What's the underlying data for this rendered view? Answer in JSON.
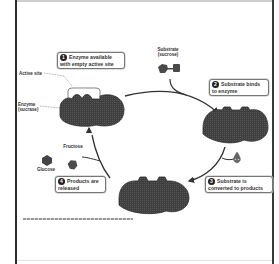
{
  "diagram": {
    "type": "enzyme catalytic cycle",
    "steps": [
      {
        "number": "1",
        "text_line1": "Enzyme available",
        "text_line2": "with empty active site"
      },
      {
        "number": "2",
        "text_line1": "Substrate binds",
        "text_line2": "to enzyme"
      },
      {
        "number": "3",
        "text_line1": "Substrate is",
        "text_line2": "converted to products"
      },
      {
        "number": "4",
        "text_line1": "Products are",
        "text_line2": "released"
      }
    ],
    "labels": {
      "active_site": "Active site",
      "enzyme_line1": "Enzyme",
      "enzyme_line2": "(sucrase)",
      "substrate_line1": "Substrate",
      "substrate_line2": "(sucrose)",
      "fructose": "Fructose",
      "glucose": "Glucose",
      "water_symbol": "H₂O"
    },
    "colors": {
      "enzyme_fill": "#3f3f3f",
      "substrate_fill": "#4a4a4a",
      "arrow": "#333333",
      "frame": "#2b2b2b",
      "box_border": "#777777"
    }
  }
}
